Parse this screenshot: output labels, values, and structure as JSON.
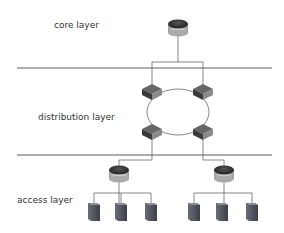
{
  "diagram": {
    "layers": [
      {
        "id": "core",
        "label": "core layer"
      },
      {
        "id": "distribution",
        "label": "distribution layer"
      },
      {
        "id": "access",
        "label": "access layer"
      }
    ],
    "nodes": {
      "core_router": {
        "type": "router",
        "layer": "core"
      },
      "dist_switches": [
        {
          "type": "switch",
          "position": "top-left"
        },
        {
          "type": "switch",
          "position": "top-right"
        },
        {
          "type": "switch",
          "position": "bottom-left"
        },
        {
          "type": "switch",
          "position": "bottom-right"
        }
      ],
      "access_routers": [
        {
          "type": "router",
          "position": "left"
        },
        {
          "type": "router",
          "position": "right"
        }
      ],
      "servers": [
        {
          "group": "left",
          "count": 3
        },
        {
          "group": "right",
          "count": 3
        }
      ]
    },
    "colors": {
      "line": "#555555",
      "router_top": "#3a3a3a",
      "router_body": "#c8c8c8",
      "switch": "#4a4a4a",
      "server": "#5c5f6a"
    }
  }
}
